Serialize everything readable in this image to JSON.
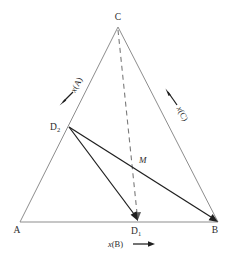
{
  "figure": {
    "type": "ternary-phase-diagram",
    "background_color": "#ffffff",
    "line_color_edges": "#8d8d8d",
    "line_color_tie": "#1f1f1f",
    "line_color_dashed": "#7a7a7a",
    "text_color": "#2b2b2b"
  },
  "vertices": {
    "a": {
      "label": "A",
      "x": 20,
      "y": 222,
      "label_x": 17,
      "label_y": 233
    },
    "b": {
      "label": "B",
      "x": 218,
      "y": 222,
      "label_x": 214,
      "label_y": 233
    },
    "c": {
      "label": "C",
      "x": 118,
      "y": 27,
      "label_x": 115,
      "label_y": 19
    }
  },
  "points": {
    "d1": {
      "label": "D",
      "subscript": "1",
      "x": 138,
      "y": 222,
      "label_x": 132,
      "label_y": 234
    },
    "d2": {
      "label": "D",
      "subscript": "2",
      "x": 69,
      "y": 127,
      "label_x": 51,
      "label_y": 130
    },
    "m": {
      "label": "M",
      "x": 135,
      "y": 165,
      "label_x": 139,
      "label_y": 163
    }
  },
  "axes": [
    {
      "name": "axis-xa",
      "label": "x(A)",
      "italic_part": "x",
      "rest_part": "(A)",
      "text_x": 79,
      "text_y": 86,
      "rotation": -62,
      "arrow_tail_x": 73,
      "arrow_tail_y": 92,
      "arrow_head_x": 60,
      "arrow_head_y": 105,
      "direction": "down-left"
    },
    {
      "name": "axis-xc",
      "label": "x(C)",
      "italic_part": "x",
      "rest_part": "(C)",
      "text_x": 180,
      "text_y": 112,
      "rotation": 62,
      "arrow_tail_x": 177,
      "arrow_tail_y": 105,
      "arrow_head_x": 165,
      "arrow_head_y": 89,
      "direction": "up-left"
    },
    {
      "name": "axis-xb",
      "label": "x(B)",
      "italic_part": "x",
      "rest_part": "(B)",
      "text_x": 108,
      "text_y": 247,
      "rotation": 0,
      "arrow_tail_x": 134,
      "arrow_tail_y": 244,
      "arrow_head_x": 154,
      "arrow_head_y": 244,
      "direction": "right"
    }
  ],
  "tie_lines": [
    {
      "name": "tie-d2-b",
      "x1": 69,
      "y1": 127,
      "x2": 218,
      "y2": 222,
      "arrowhead": "end"
    },
    {
      "name": "tie-d2-d1",
      "x1": 69,
      "y1": 127,
      "x2": 138,
      "y2": 222,
      "arrowhead": "end"
    }
  ],
  "dashed_lines": [
    {
      "name": "dashed-c-d1",
      "x1": 118,
      "y1": 30,
      "x2": 138,
      "y2": 220,
      "arrowhead": "end"
    }
  ]
}
